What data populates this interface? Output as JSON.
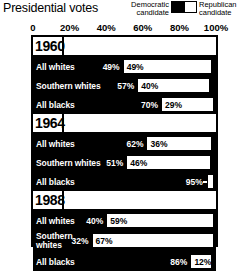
{
  "header": {
    "title": "Presidential votes",
    "legend": {
      "democratic": "Democratic\ncandidate",
      "democratic_line1": "Democratic",
      "democratic_line2": "candidate",
      "republican_line1": "Republican",
      "republican_line2": "candidate",
      "democratic_color": "#000000",
      "republican_color": "#ffffff"
    }
  },
  "axis": {
    "ticks": [
      "0",
      "20%",
      "40%",
      "60%",
      "80%",
      "100%"
    ],
    "values": [
      0,
      20,
      40,
      60,
      80,
      100
    ]
  },
  "groups": [
    {
      "year": "1960",
      "rows": [
        {
          "label": "All whites",
          "dem": "49%",
          "rep": "49%",
          "dem_value": 49,
          "rep_value": 49
        },
        {
          "label": "Southern whites",
          "dem": "57%",
          "rep": "40%",
          "dem_value": 57,
          "rep_value": 40
        },
        {
          "label": "All blacks",
          "dem": "70%",
          "rep": "29%",
          "dem_value": 70,
          "rep_value": 29
        }
      ]
    },
    {
      "year": "1964",
      "rows": [
        {
          "label": "All whites",
          "dem": "62%",
          "rep": "36%",
          "dem_value": 62,
          "rep_value": 36
        },
        {
          "label": "Southern whites",
          "dem": "51%",
          "rep": "46%",
          "dem_value": 51,
          "rep_value": 46
        },
        {
          "label": "All blacks",
          "dem": "95%",
          "rep": "3%",
          "dem_value": 95,
          "rep_value": 3
        }
      ]
    },
    {
      "year": "1988",
      "rows": [
        {
          "label": "All whites",
          "dem": "40%",
          "rep": "59%",
          "dem_value": 40,
          "rep_value": 59
        },
        {
          "label": "Southern whites",
          "dem": "32%",
          "rep": "67%",
          "dem_value": 32,
          "rep_value": 67
        },
        {
          "label": "All blacks",
          "dem": "86%",
          "rep": "12%",
          "dem_value": 86,
          "rep_value": 12
        }
      ]
    }
  ],
  "chart_data": {
    "type": "bar",
    "title": "Presidential votes",
    "orientation": "horizontal",
    "stacked": true,
    "xlabel": "",
    "ylabel": "",
    "xlim": [
      0,
      100
    ],
    "xticks": [
      0,
      20,
      40,
      60,
      80,
      100
    ],
    "xtick_labels": [
      "0",
      "20%",
      "40%",
      "60%",
      "80%",
      "100%"
    ],
    "grid": true,
    "legend_position": "top-right",
    "legend": [
      "Democratic candidate",
      "Republican candidate"
    ],
    "colors": {
      "Democratic candidate": "#000000",
      "Republican candidate": "#ffffff"
    },
    "categories": [
      "1960 All whites",
      "1960 Southern whites",
      "1960 All blacks",
      "1964 All whites",
      "1964 Southern whites",
      "1964 All blacks",
      "1988 All whites",
      "1988 Southern whites",
      "1988 All blacks"
    ],
    "series": [
      {
        "name": "Democratic candidate",
        "values": [
          49,
          57,
          70,
          62,
          51,
          95,
          40,
          32,
          86
        ]
      },
      {
        "name": "Republican candidate",
        "values": [
          49,
          40,
          29,
          36,
          46,
          3,
          59,
          67,
          12
        ]
      }
    ]
  }
}
